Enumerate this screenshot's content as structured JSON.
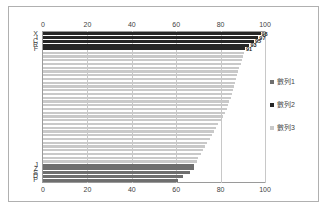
{
  "chart_data": {
    "type": "bar",
    "orientation": "horizontal",
    "title": "",
    "xlabel": "",
    "ylabel": "",
    "xlim": [
      0,
      100
    ],
    "xticks": [
      0,
      20,
      40,
      60,
      80,
      100
    ],
    "grid": true,
    "axis_top": true,
    "axis_bottom": true,
    "legend_position": "right",
    "series": [
      {
        "name": "數列1",
        "color": "#6e6e6e",
        "note": "lower group bars",
        "categories": [
          "J",
          "Z",
          "S",
          "D",
          "P"
        ],
        "values": [
          68,
          68,
          66,
          63,
          61
        ]
      },
      {
        "name": "數列2",
        "color": "#262626",
        "note": "upper group bars with data labels",
        "categories": [
          "X",
          "I",
          "C",
          "R",
          "F"
        ],
        "values": [
          98,
          97,
          95,
          93,
          91
        ],
        "data_labels": [
          "98",
          "97",
          "95",
          "93",
          "91"
        ]
      },
      {
        "name": "數列3",
        "color": "#c9c9c9",
        "note": "middle unlabeled bars, descending staircase",
        "values": [
          90.5,
          90,
          89.5,
          89,
          88.5,
          88,
          87.5,
          87,
          86.5,
          86,
          85.5,
          85,
          84.5,
          84,
          83.5,
          83,
          82,
          81,
          80,
          79,
          78,
          77,
          76,
          75,
          74,
          73,
          72,
          71,
          70,
          69.5
        ]
      }
    ],
    "categories_top": [
      "X",
      "I",
      "C",
      "R",
      "F"
    ],
    "categories_bottom": [
      "J",
      "Z",
      "S",
      "D",
      "P"
    ],
    "legend_entries": [
      {
        "label": "數列1",
        "color": "#6e6e6e"
      },
      {
        "label": "數列2",
        "color": "#262626"
      },
      {
        "label": "數列3",
        "color": "#c9c9c9"
      }
    ]
  }
}
